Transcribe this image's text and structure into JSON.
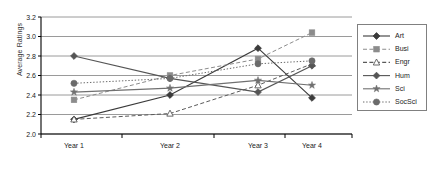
{
  "chart_data": {
    "type": "line",
    "title": "",
    "xlabel": "",
    "ylabel": "Average Ratings",
    "categories": [
      "Year 1",
      "Year 2",
      "Year 3",
      "Year 4"
    ],
    "ylim": [
      2.0,
      3.2
    ],
    "ytick_labels": [
      "2.0",
      "2.2",
      "2.4",
      "2.6",
      "2.8",
      "3.0",
      "3.2"
    ],
    "ytick_values": [
      2.0,
      2.2,
      2.4,
      2.6,
      2.8,
      3.0,
      3.2
    ],
    "grid": "horizontal",
    "legend_position": "right",
    "series": [
      {
        "name": "Art",
        "values": [
          2.15,
          2.4,
          2.88,
          2.37
        ],
        "marker": "filled-diamond",
        "line_style": "solid",
        "color": "#3b3b3b"
      },
      {
        "name": "Busi",
        "values": [
          2.35,
          2.6,
          2.77,
          3.04
        ],
        "marker": "filled-square",
        "line_style": "dashed",
        "color": "#8c8c8c"
      },
      {
        "name": "Engr",
        "values": [
          2.15,
          2.21,
          2.5,
          2.72
        ],
        "marker": "open-triangle",
        "line_style": "dashed",
        "color": "#5a5a5a"
      },
      {
        "name": "Hum",
        "values": [
          2.8,
          2.57,
          2.43,
          2.7
        ],
        "marker": "filled-diamond",
        "line_style": "solid",
        "color": "#555555"
      },
      {
        "name": "Sci",
        "values": [
          2.43,
          2.47,
          2.55,
          2.5
        ],
        "marker": "star",
        "line_style": "solid",
        "color": "#707070"
      },
      {
        "name": "SocSci",
        "values": [
          2.52,
          2.57,
          2.72,
          2.75
        ],
        "marker": "filled-circle",
        "line_style": "dotted",
        "color": "#6b6b6b"
      }
    ]
  },
  "legend": {
    "items": [
      {
        "label": "Art"
      },
      {
        "label": "Busi"
      },
      {
        "label": "Engr"
      },
      {
        "label": "Hum"
      },
      {
        "label": "Sci"
      },
      {
        "label": "SocSci"
      }
    ]
  },
  "colors": {
    "axis": "#000000",
    "grid": "#808080",
    "text": "#222222",
    "legend_border": "#808080",
    "background": "#ffffff"
  }
}
